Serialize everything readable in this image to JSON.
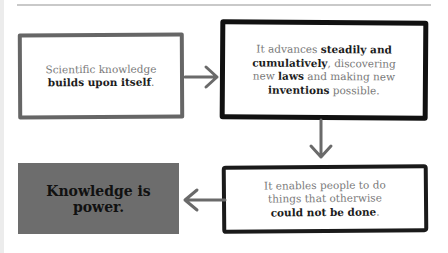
{
  "diagram": {
    "type": "flowchart",
    "nodes": [
      {
        "id": "box1",
        "segments": [
          {
            "text": "Scientific knowledge ",
            "bold": false
          },
          {
            "text": "builds upon itself",
            "bold": true
          },
          {
            "text": ".",
            "bold": false
          }
        ]
      },
      {
        "id": "box2",
        "segments": [
          {
            "text": "It advances ",
            "bold": false
          },
          {
            "text": "steadily and cumulatively",
            "bold": true
          },
          {
            "text": ", discovering new ",
            "bold": false
          },
          {
            "text": "laws",
            "bold": true
          },
          {
            "text": " and making new ",
            "bold": false
          },
          {
            "text": "inventions",
            "bold": true
          },
          {
            "text": " possible.",
            "bold": false
          }
        ]
      },
      {
        "id": "box3",
        "segments": [
          {
            "text": "It enables people to do things that otherwise ",
            "bold": false
          },
          {
            "text": "could not be done",
            "bold": true
          },
          {
            "text": ".",
            "bold": false
          }
        ]
      },
      {
        "id": "box4",
        "segments": [
          {
            "text": "Knowledge is power.",
            "bold": true
          }
        ]
      }
    ],
    "edges": [
      {
        "from": "box1",
        "to": "box2",
        "direction": "right"
      },
      {
        "from": "box2",
        "to": "box3",
        "direction": "down"
      },
      {
        "from": "box3",
        "to": "box4",
        "direction": "left"
      }
    ],
    "colors": {
      "box1_border": "#666666",
      "box2_border": "#111111",
      "box3_border": "#1a1a1a",
      "box4_fill": "#6d6d6d",
      "arrow": "#6a6a6a",
      "body_text": "#7a7a7a",
      "bold_text": "#1c1c1c"
    }
  },
  "box1": {
    "l1": "Scientific knowledge",
    "b1": "builds upon itself",
    "end": "."
  },
  "box2": {
    "t1": "It advances ",
    "b1": "steadily and",
    "b2": "cumulatively",
    "t2": ", discovering",
    "t3": "new ",
    "b3": "laws",
    "t4": " and making new",
    "b4": "inventions",
    "t5": " possible."
  },
  "box3": {
    "l1": "It enables people to do",
    "l2": "things that otherwise",
    "b1": "could not be done",
    "end": "."
  },
  "box4": {
    "l1": "Knowledge is",
    "l2": "power."
  }
}
